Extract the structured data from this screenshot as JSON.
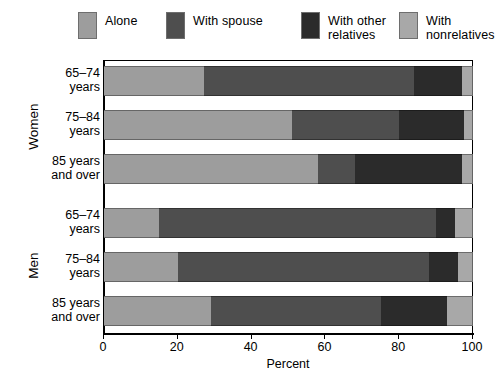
{
  "chart_data": {
    "type": "bar",
    "orientation": "horizontal",
    "stacked": true,
    "title": "",
    "xlabel": "Percent",
    "ylabel": "",
    "xlim": [
      0,
      100
    ],
    "xticks": [
      0,
      20,
      40,
      60,
      80,
      100
    ],
    "xticklabels": [
      "0",
      "20",
      "40",
      "60",
      "80",
      "100"
    ],
    "grid": false,
    "legend_position": "top",
    "series": [
      {
        "name": "Alone",
        "color": "#9d9d9d",
        "values": [
          27,
          51,
          58,
          15,
          20,
          29
        ]
      },
      {
        "name": "With spouse",
        "color": "#4e4e4e",
        "values": [
          57,
          29,
          10,
          75,
          68,
          46
        ]
      },
      {
        "name": "With other relatives",
        "color": "#2b2b2b",
        "values": [
          13,
          17.5,
          29,
          5,
          8,
          18
        ]
      },
      {
        "name": "With nonrelatives",
        "color": "#a8a8a8",
        "values": [
          3,
          2.5,
          3,
          5,
          4,
          7
        ]
      }
    ],
    "groups": [
      {
        "label": "Women",
        "categories": [
          "65–74\nyears",
          "75–84\nyears",
          "85 years\nand over"
        ]
      },
      {
        "label": "Men",
        "categories": [
          "65–74\nyears",
          "75–84\nyears",
          "85 years\nand over"
        ]
      }
    ],
    "categories": [
      "Women 65–74 years",
      "Women 75–84 years",
      "Women 85 years and over",
      "Men 65–74 years",
      "Men 75–84 years",
      "Men 85 years and over"
    ]
  },
  "legend": {
    "items": [
      {
        "label": "Alone",
        "color": "#9d9d9d"
      },
      {
        "label": "With spouse",
        "color": "#4e4e4e"
      },
      {
        "label": "With other\nrelatives",
        "color": "#2b2b2b"
      },
      {
        "label": "With\nnonrelatives",
        "color": "#a8a8a8"
      }
    ]
  },
  "axis": {
    "x_title": "Percent",
    "ticks": [
      "0",
      "20",
      "40",
      "60",
      "80",
      "100"
    ]
  },
  "rows": [
    {
      "label": "65–74\nyears",
      "group": "Women"
    },
    {
      "label": "75–84\nyears",
      "group": "Women"
    },
    {
      "label": "85 years\nand over",
      "group": "Women"
    },
    {
      "label": "65–74\nyears",
      "group": "Men"
    },
    {
      "label": "75–84\nyears",
      "group": "Men"
    },
    {
      "label": "85 years\nand over",
      "group": "Men"
    }
  ],
  "groups": [
    {
      "label": "Women"
    },
    {
      "label": "Men"
    }
  ]
}
